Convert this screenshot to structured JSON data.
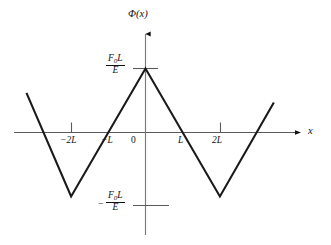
{
  "figure": {
    "background_color": "#ffffff",
    "line_color": "#1a1a1a",
    "axis_color": "#4d4d4d"
  },
  "axes": {
    "y_axis_label": "Φ(x)",
    "x_axis_label": "x",
    "x_tick_labels": [
      "−2L",
      "−L",
      "0",
      "L",
      "2L"
    ],
    "y_tick_labels": {
      "positive": {
        "numerator_main": "F",
        "numerator_sub": "0",
        "numerator_tail": "L",
        "denominator": "E"
      },
      "negative_sign": "−",
      "negative": {
        "numerator_main": "F",
        "numerator_sub": "0",
        "numerator_tail": "L",
        "denominator": "E"
      }
    }
  },
  "chart_data": {
    "type": "line",
    "title": "",
    "subtitle": "",
    "xlabel": "x",
    "ylabel": "Φ(x)",
    "xlim": [
      -3.5,
      3.5
    ],
    "ylim": [
      -1.45,
      1.45
    ],
    "grid": false,
    "legend": null,
    "x_ticks": [
      -2,
      -1,
      0,
      1,
      2
    ],
    "x_tick_labels": [
      "−2L",
      "−L",
      "0",
      "L",
      "2L"
    ],
    "x_tick_marks_drawn_at": [
      -2,
      2
    ],
    "y_ticks": [
      -1,
      1
    ],
    "y_tick_labels": [
      "−F₀L/E",
      "F₀L/E"
    ],
    "x_unit": "L",
    "y_unit": "F₀L/E",
    "series": [
      {
        "name": "Φ(x)",
        "x": [
          -3.2,
          -2.0,
          0.0,
          2.0,
          3.45
        ],
        "y": [
          0.62,
          -1.0,
          1.0,
          -1.0,
          0.47
        ],
        "color": "#1a1a1a",
        "linewidth": 2.1
      }
    ],
    "annotations": []
  }
}
